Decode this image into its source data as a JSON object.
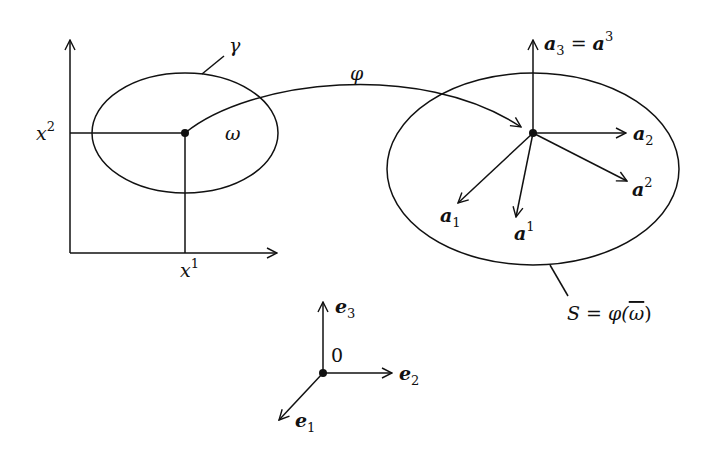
{
  "diagram": {
    "type": "parametrized-surface-mapping",
    "colors": {
      "stroke": "#111111",
      "background": "#ffffff"
    },
    "domain": {
      "axis_horizontal_label": "x",
      "axis_horizontal_sup": "1",
      "axis_vertical_label": "x",
      "axis_vertical_sup": "2",
      "region_label": "ω",
      "boundary_label": "γ"
    },
    "mapping": {
      "label": "φ"
    },
    "surface": {
      "label_S": "S = φ(",
      "label_omega_bar": "ω",
      "label_close": ")",
      "vectors": [
        {
          "id": "a3",
          "base": "a",
          "sub": "3",
          "eq": " = ",
          "base2": "a",
          "sup2": "3"
        },
        {
          "id": "a2",
          "base": "a",
          "sub": "2"
        },
        {
          "id": "a-sup2",
          "base": "a",
          "sup": "2"
        },
        {
          "id": "a1",
          "base": "a",
          "sub": "1"
        },
        {
          "id": "a-sup1",
          "base": "a",
          "sup": "1"
        }
      ]
    },
    "frame": {
      "origin_label": "0",
      "vectors": [
        {
          "id": "e1",
          "base": "e",
          "sub": "1"
        },
        {
          "id": "e2",
          "base": "e",
          "sub": "2"
        },
        {
          "id": "e3",
          "base": "e",
          "sub": "3"
        }
      ]
    }
  }
}
